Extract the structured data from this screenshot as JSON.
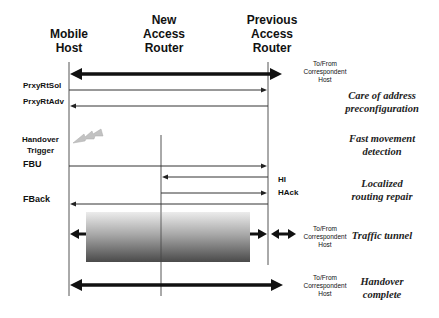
{
  "diagram": {
    "type": "sequence",
    "entities": [
      {
        "id": "mh",
        "label_lines": [
          "Mobile",
          "Host"
        ],
        "x": 69
      },
      {
        "id": "nar",
        "label_lines": [
          "New",
          "Access",
          "Router"
        ],
        "x": 161
      },
      {
        "id": "par",
        "label_lines": [
          "Previous",
          "Access",
          "Router"
        ],
        "x": 268
      }
    ],
    "headers": {
      "mobile_host": "Mobile\nHost",
      "mh_line1": "Mobile",
      "mh_line2": "Host",
      "nar_line1": "New",
      "nar_line2": "Access",
      "nar_line3": "Router",
      "par_line1": "Previous",
      "par_line2": "Access",
      "par_line3": "Router"
    },
    "messages": {
      "prxyrtsol": "PrxyRtSol",
      "prxyrtadv": "PrxyRtAdv",
      "handover_trigger_1": "Handover",
      "handover_trigger_2": "Trigger",
      "fbu": "FBU",
      "hi": "HI",
      "hack": "HAck",
      "fback": "FBack"
    },
    "correspondent": {
      "line1": "To/From",
      "line2": "Correspondent",
      "line3": "Host"
    },
    "phases": {
      "p1_l1": "Care of address",
      "p1_l2": "preconfiguration",
      "p2_l1": "Fast movement",
      "p2_l2": "detection",
      "p3_l1": "Localized",
      "p3_l2": "routing repair",
      "p4_l1": "Traffic tunnel",
      "p5_l1": "Handover",
      "p5_l2": "complete"
    },
    "colors": {
      "line": "#333333",
      "arrow_thick": "#111111",
      "tunnel_top": "#e8e8e8",
      "tunnel_bottom": "#555555",
      "trigger": "#b0b0b0"
    }
  }
}
